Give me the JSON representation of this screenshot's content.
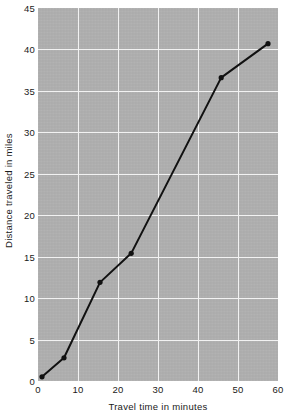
{
  "chart_data": {
    "type": "line",
    "title": "",
    "xlabel": "Travel time in minutes",
    "ylabel": "Distance traveled in miles",
    "xlim": [
      0,
      60
    ],
    "ylim": [
      0,
      45
    ],
    "xticks": [
      0,
      10,
      20,
      30,
      40,
      50,
      60
    ],
    "yticks": [
      0,
      5,
      10,
      15,
      20,
      25,
      30,
      35,
      40,
      45
    ],
    "grid": true,
    "legend": null,
    "plot_background_color": "#b1b1b1",
    "gridline_color": "#f2f2f2",
    "line_color": "#111111",
    "marker": "circle",
    "series": [
      {
        "name": "Distance traveled",
        "x": [
          1.0,
          6.5,
          15.5,
          23.3,
          45.8,
          57.5
        ],
        "y": [
          0.5,
          2.8,
          11.9,
          15.4,
          36.6,
          40.7
        ]
      }
    ]
  }
}
